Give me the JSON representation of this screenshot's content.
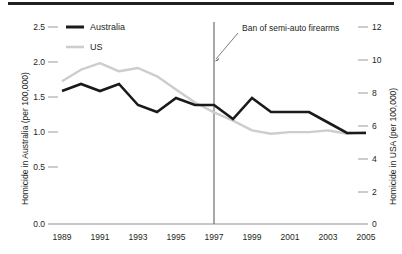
{
  "chart_data": {
    "type": "line",
    "title": "",
    "xlabel": "",
    "ylabel": "Homicide in Australia (per 100,000)",
    "y2label": "Homicide in USA (per 100,000)",
    "grid": false,
    "legend_position": "top-left",
    "x": [
      1989,
      1990,
      1991,
      1992,
      1993,
      1994,
      1995,
      1996,
      1997,
      1998,
      1999,
      2000,
      2001,
      2002,
      2003,
      2004,
      2005
    ],
    "xlim": [
      1989,
      2005
    ],
    "xtick_labels": [
      "1989",
      "1991",
      "1993",
      "1995",
      "1997",
      "1999",
      "2001",
      "2003",
      "2005"
    ],
    "xticks": [
      1989,
      1991,
      1993,
      1995,
      1997,
      1999,
      2001,
      2003,
      2005
    ],
    "ylim": [
      0.0,
      2.5
    ],
    "ytick_labels": [
      "0.0",
      "0.5",
      "1.0",
      "1.5",
      "2.0",
      "2.5"
    ],
    "yticks": [
      0.0,
      0.5,
      1.0,
      1.5,
      2.0,
      2.5
    ],
    "y2lim": [
      0,
      12
    ],
    "y2tick_labels": [
      "0",
      "2",
      "4",
      "6",
      "8",
      "10",
      "12"
    ],
    "y2ticks": [
      0,
      2,
      4,
      6,
      8,
      10,
      12
    ],
    "series": [
      {
        "name": "Australia",
        "axis": "left",
        "color": "#1a1a1a",
        "values": [
          1.9,
          2.0,
          1.9,
          2.0,
          1.7,
          1.6,
          1.8,
          1.7,
          1.7,
          1.5,
          1.8,
          1.6,
          1.6,
          1.6,
          1.45,
          1.3,
          1.3
        ]
      },
      {
        "name": "US",
        "axis": "right",
        "color": "#cdcdcd",
        "values": [
          8.7,
          9.4,
          9.8,
          9.3,
          9.5,
          9.0,
          8.2,
          7.4,
          6.8,
          6.3,
          5.7,
          5.5,
          5.6,
          5.6,
          5.7,
          5.5,
          5.6
        ]
      }
    ],
    "annotations": [
      {
        "text": "Ban of semi-auto firearms",
        "x": 1997,
        "kind": "vertical-line-with-arrow"
      }
    ]
  },
  "legend": {
    "items": [
      {
        "label": "Australia"
      },
      {
        "label": "US"
      }
    ]
  },
  "axes": {
    "left_title": "Homicide in Australia (per 100,000)",
    "right_title": "Homicide in USA (per 100,000)"
  },
  "annotation": {
    "text": "Ban of semi-auto firearms"
  }
}
